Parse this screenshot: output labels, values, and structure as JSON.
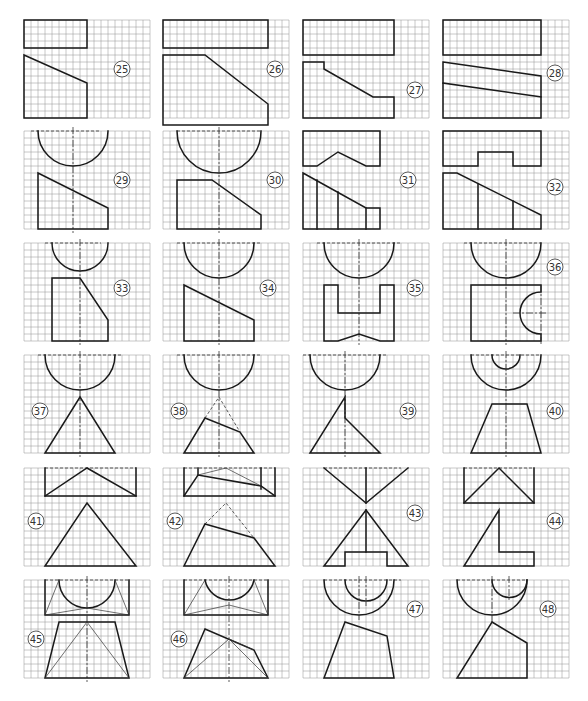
{
  "sheet": {
    "description": "Orthographic projection exercises on grid paper: given views, complete the missing view",
    "grid": {
      "cell_px": 7,
      "cols": 18,
      "rows": 14,
      "line_color": "#9a9a9a"
    },
    "line_color": "#1a1a1a",
    "background": "#ffffff"
  },
  "problems": [
    {
      "number": "25",
      "row": 0,
      "col": 0
    },
    {
      "number": "26",
      "row": 0,
      "col": 1
    },
    {
      "number": "27",
      "row": 0,
      "col": 2
    },
    {
      "number": "28",
      "row": 0,
      "col": 3
    },
    {
      "number": "29",
      "row": 1,
      "col": 0
    },
    {
      "number": "30",
      "row": 1,
      "col": 1
    },
    {
      "number": "31",
      "row": 1,
      "col": 2
    },
    {
      "number": "32",
      "row": 1,
      "col": 3
    },
    {
      "number": "33",
      "row": 2,
      "col": 0
    },
    {
      "number": "34",
      "row": 2,
      "col": 1
    },
    {
      "number": "35",
      "row": 2,
      "col": 2
    },
    {
      "number": "36",
      "row": 2,
      "col": 3
    },
    {
      "number": "37",
      "row": 3,
      "col": 0
    },
    {
      "number": "38",
      "row": 3,
      "col": 1
    },
    {
      "number": "39",
      "row": 3,
      "col": 2
    },
    {
      "number": "40",
      "row": 3,
      "col": 3
    },
    {
      "number": "41",
      "row": 4,
      "col": 0
    },
    {
      "number": "42",
      "row": 4,
      "col": 1
    },
    {
      "number": "43",
      "row": 4,
      "col": 2
    },
    {
      "number": "44",
      "row": 4,
      "col": 3
    },
    {
      "number": "45",
      "row": 5,
      "col": 0
    },
    {
      "number": "46",
      "row": 5,
      "col": 1
    },
    {
      "number": "47",
      "row": 5,
      "col": 2
    },
    {
      "number": "48",
      "row": 5,
      "col": 3
    }
  ]
}
